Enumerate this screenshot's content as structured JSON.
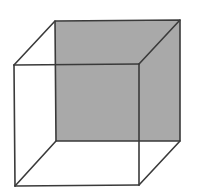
{
  "diagram": {
    "type": "wireframe-cube",
    "shaded_face": "back",
    "colors": {
      "background": "#ffffff",
      "edge": "#3a3a3a",
      "back_face_fill": "#a9a9a9"
    },
    "vertices": {
      "back_top_left": [
        55,
        21
      ],
      "back_top_right": [
        180,
        20
      ],
      "back_bottom_left": [
        56,
        141
      ],
      "back_bottom_right": [
        180,
        141
      ],
      "front_top_left": [
        14,
        65
      ],
      "front_top_right": [
        139,
        64
      ],
      "front_bottom_left": [
        15,
        186
      ],
      "front_bottom_right": [
        139,
        185
      ]
    }
  }
}
